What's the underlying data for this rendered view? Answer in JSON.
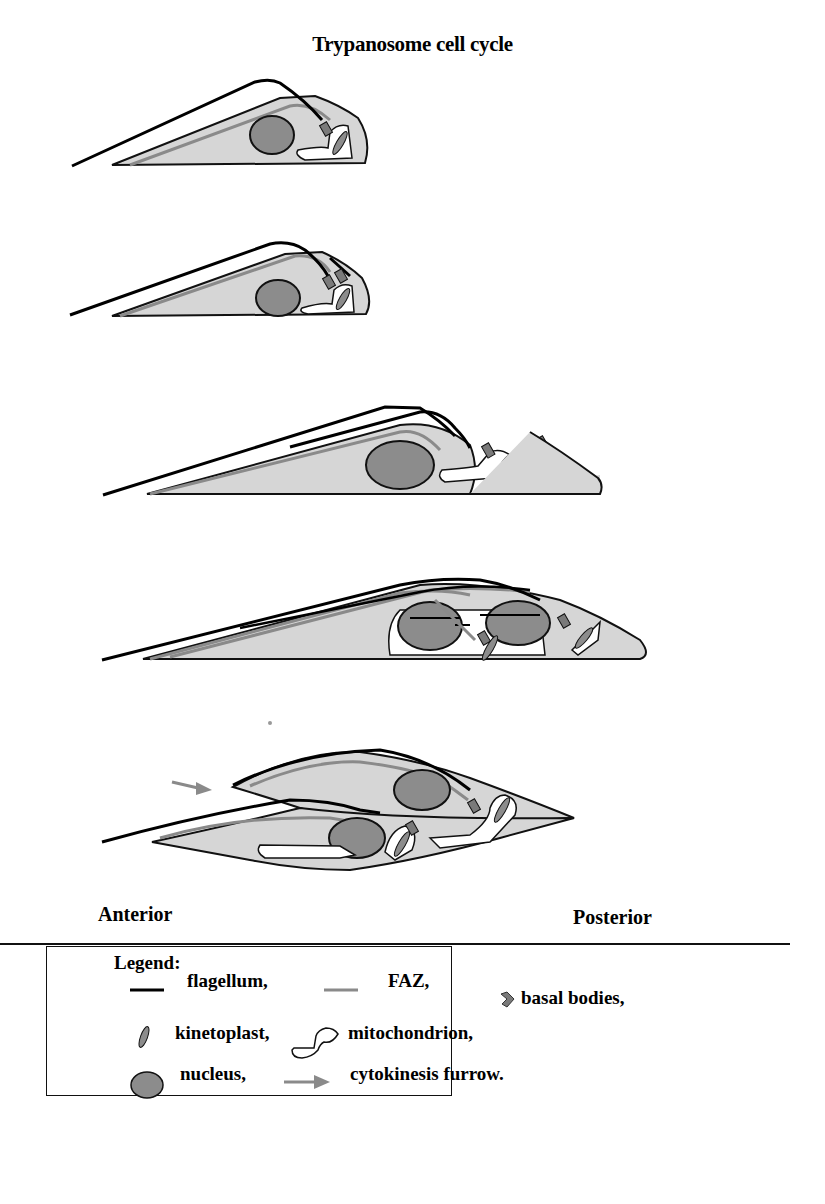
{
  "figure": {
    "title": "Trypanosome cell cycle",
    "stages": [
      {
        "index": 1,
        "description": "G1 cell: one flagellum, one basal body pair, one kinetoplast, one nucleus"
      },
      {
        "index": 2,
        "description": "New flagellum begins to grow from second basal body"
      },
      {
        "index": 3,
        "description": "Two flagella, kinetoplast divided"
      },
      {
        "index": 4,
        "description": "Mitosis: nucleus dividing"
      },
      {
        "index": 5,
        "description": "Cytokinesis: two daughter cells separating along furrow"
      }
    ],
    "axis_labels": {
      "anterior": "Anterior",
      "posterior": "Posterior"
    }
  },
  "legend": {
    "heading": "Legend:",
    "items": [
      {
        "symbol": "black-line",
        "label": "flagellum,"
      },
      {
        "symbol": "grey-line",
        "label": "FAZ,"
      },
      {
        "symbol": "basal-body-diamond",
        "label": "basal bodies,"
      },
      {
        "symbol": "kinetoplast-ellipse",
        "label": "kinetoplast,"
      },
      {
        "symbol": "mitochondrion-outline",
        "label": "mitochondrion,"
      },
      {
        "symbol": "nucleus-circle",
        "label": "nucleus,"
      },
      {
        "symbol": "grey-arrow",
        "label": "cytokinesis furrow."
      }
    ]
  },
  "colors": {
    "cell_fill": "#d6d6d6",
    "nucleus_fill": "#8c8c8c",
    "faz": "#8a8a8a",
    "flagellum": "#000000",
    "mitochondrion_fill": "#ffffff",
    "arrow": "#8a8a8a"
  }
}
